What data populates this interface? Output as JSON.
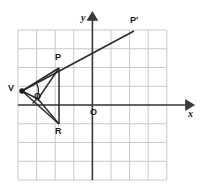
{
  "figure": {
    "type": "coordinate-geometry-diagram",
    "colors": {
      "grid": "#c8c8c8",
      "axis": "#3a3a3a",
      "shape": "#2a2a2a",
      "label": "#1a1a1a",
      "background": "#ffffff"
    },
    "grid": {
      "x_left": 18,
      "x_right": 167,
      "y_top": 30,
      "y_bottom": 180,
      "cell": 18.6,
      "columns": 8,
      "rows": 8,
      "visible": true
    },
    "axes": {
      "x_axis": {
        "label": "x",
        "y_pixel": 105,
        "x_start": 18,
        "x_end": 191,
        "arrow": "right"
      },
      "y_axis": {
        "label": "y",
        "x_pixel": 92,
        "y_start": 180,
        "y_end": 14,
        "arrow": "up"
      },
      "origin_label": "O"
    },
    "points": [
      {
        "name": "V",
        "label": "V",
        "x": 22,
        "y": 91,
        "dot": true,
        "label_dx": -11,
        "label_dy": -5
      },
      {
        "name": "P",
        "label": "P",
        "x": 59,
        "y": 68,
        "dot": false,
        "label_dx": -3,
        "label_dy": -14
      },
      {
        "name": "R",
        "label": "R",
        "x": 59,
        "y": 124,
        "dot": false,
        "label_dx": -3,
        "label_dy": 4
      },
      {
        "name": "Q",
        "label": "Q",
        "x": 38,
        "y": 98,
        "dot": false,
        "label_dx": -3,
        "label_dy": -5
      },
      {
        "name": "Pprime",
        "label": "P'",
        "x": 134,
        "y": 31,
        "dot": false,
        "label_dx": -3,
        "label_dy": -14
      }
    ],
    "segments": [
      {
        "name": "V-P",
        "from": "V",
        "to": "P"
      },
      {
        "name": "V-R",
        "from": "V",
        "to": "R"
      },
      {
        "name": "P-R",
        "from": "P",
        "to": "R"
      },
      {
        "name": "V-Q",
        "from": "V",
        "to": "Q"
      },
      {
        "name": "Q-P",
        "from": "Q",
        "to": "P"
      },
      {
        "name": "Q-R",
        "from": "Q",
        "to": "R"
      },
      {
        "name": "ray-V-Pprime",
        "from": "V",
        "to": "Pprime"
      }
    ],
    "angle_arc": {
      "name": "arc-at-V",
      "center_x": 22,
      "center_y": 91,
      "radius": 15
    }
  }
}
